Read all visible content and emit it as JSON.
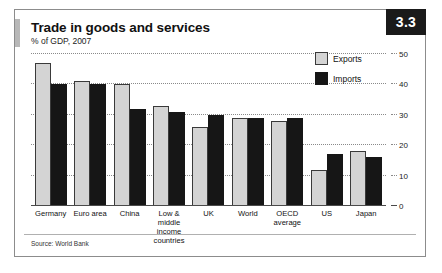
{
  "badge": "3.3",
  "title": "Trade in goods and services",
  "subtitle": "% of GDP, 2007",
  "source": "Source: World Bank",
  "legend": {
    "exports_label": "Exports",
    "imports_label": "Imports",
    "exports_color": "#d4d4d4",
    "imports_color": "#161616"
  },
  "chart_data": {
    "type": "bar",
    "title": "Trade in goods and services",
    "subtitle": "% of GDP, 2007",
    "xlabel": "",
    "ylabel": "% of GDP",
    "ylim": [
      0,
      50
    ],
    "yticks": [
      0,
      10,
      20,
      30,
      40,
      50
    ],
    "grid": true,
    "axis_position": "right",
    "legend_position": "top-right",
    "categories": [
      "Germany",
      "Euro area",
      "China",
      "Low & middle income countries",
      "UK",
      "World",
      "OECD average",
      "US",
      "Japan"
    ],
    "series": [
      {
        "name": "Exports",
        "values": [
          47,
          41,
          40,
          33,
          26,
          29,
          28,
          12,
          18
        ]
      },
      {
        "name": "Imports",
        "values": [
          40,
          40,
          32,
          31,
          30,
          29,
          29,
          17,
          16
        ]
      }
    ]
  }
}
